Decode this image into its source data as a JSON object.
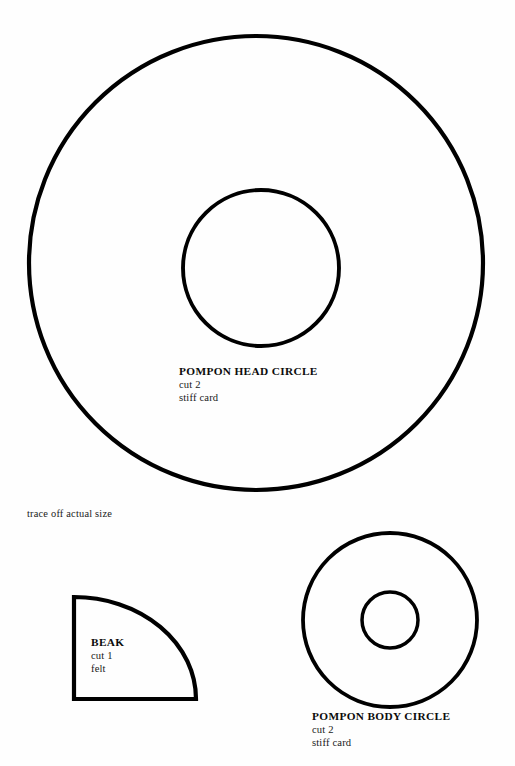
{
  "page": {
    "kind": "craft-pattern-template-sheet",
    "background_color": "#fefefe",
    "ink_color": "#000000",
    "width": 515,
    "height": 766
  },
  "notes": {
    "trace_instruction": "trace off actual size"
  },
  "pieces": [
    {
      "id": "pompon-head-circle",
      "title": "POMPON HEAD CIRCLE",
      "quantity_label": "cut 2",
      "material_label": "stiff card",
      "shape": "annulus",
      "cx": 256,
      "cy": 263,
      "outer_r": 227,
      "inner_cx": 261,
      "inner_cy": 268,
      "inner_r": 78,
      "stroke_width": 4.2,
      "stroke_color": "#000000",
      "fill_color": "#fefefe"
    },
    {
      "id": "beak",
      "title": "BEAK",
      "quantity_label": "cut 1",
      "material_label": "felt",
      "shape": "quarter-disc",
      "left": 74,
      "top": 597,
      "right": 196,
      "bottom": 699,
      "stroke_width": 4.2,
      "stroke_color": "#000000",
      "fill_color": "#fefefe"
    },
    {
      "id": "pompon-body-circle",
      "title": "POMPON BODY CIRCLE",
      "quantity_label": "cut 2",
      "material_label": "stiff card",
      "shape": "annulus",
      "cx": 390,
      "cy": 620,
      "outer_r": 87,
      "inner_cx": 390,
      "inner_cy": 620,
      "inner_r": 28,
      "stroke_width": 3.8,
      "stroke_color": "#000000",
      "fill_color": "#fefefe"
    }
  ]
}
